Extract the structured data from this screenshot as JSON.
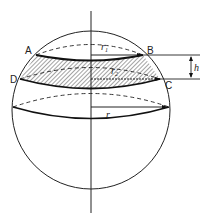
{
  "diagram": {
    "points": {
      "A": "A",
      "B": "B",
      "C": "C",
      "D": "D"
    },
    "labels": {
      "r1": "r",
      "r1_sub": "1",
      "r2": "r",
      "r2_sub": "2",
      "r": "r",
      "h": "h"
    },
    "colors": {
      "stroke": "#222222",
      "hatch": "#333333",
      "background": "#ffffff"
    }
  }
}
